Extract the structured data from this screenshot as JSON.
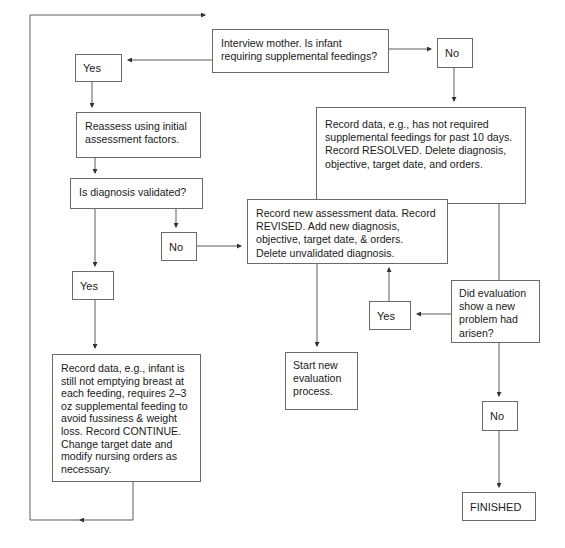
{
  "nodes": {
    "interview": "Interview mother. Is infant\nrequiring supplemental feedings?",
    "yes_top": "Yes",
    "no_top": "No",
    "reassess": "Reassess using initial\nassessment factors.",
    "resolved": "Record data, e.g., has not required\nsupplemental feedings for past 10 days.\nRecord RESOLVED. Delete diagnosis,\nobjective, target date, and orders.",
    "validated_q": "Is diagnosis validated?",
    "no_mid": "No",
    "revised": "Record new assessment data. Record\nREVISED. Add new diagnosis,\nobjective, target date, & orders.\nDelete unvalidated diagnosis.",
    "yes_mid": "Yes",
    "new_problem_q": "Did evaluation\nshow a new\nproblem had\narisen?",
    "yes_right": "Yes",
    "start_new": "Start new\nevaluation\nprocess.",
    "continue": "Record data, e.g., infant is\nstill not emptying breast at\neach feeding, requires 2–3\noz supplemental feeding to\navoid fussiness & weight\nloss. Record CONTINUE.\nChange target date and\nmodify nursing orders as\nnecessary.",
    "no_bottom": "No",
    "finished": "FINISHED"
  },
  "colors": {
    "line": "#5a5a5a",
    "border": "#6a6a6a",
    "text": "#1a1a1a",
    "background": "#ffffff"
  }
}
